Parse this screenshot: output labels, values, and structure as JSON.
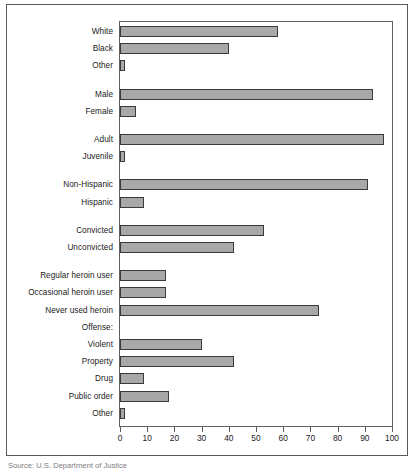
{
  "chart_data": {
    "type": "bar",
    "orientation": "horizontal",
    "title": "",
    "xlabel": "",
    "ylabel": "",
    "xlim": [
      0,
      100
    ],
    "xticks": [
      0,
      10,
      20,
      30,
      40,
      50,
      60,
      70,
      80,
      90,
      100
    ],
    "grid": false,
    "legend": null,
    "bar_color": "#a8a8a8",
    "bar_edge_color": "#3a3a3a",
    "categories": [
      "White",
      "Black",
      "Other",
      "Male",
      "Female",
      "Adult",
      "Juvenile",
      "Non-Hispanic",
      "Hispanic",
      "Convicted",
      "Unconvicted",
      "Regular heroin user",
      "Occasional heroin user",
      "Never used heroin",
      "Violent",
      "Property",
      "Drug",
      "Public order",
      "Other"
    ],
    "values": [
      58,
      40,
      2,
      93,
      6,
      97,
      2,
      91,
      9,
      53,
      42,
      17,
      17,
      73,
      30,
      42,
      9,
      18,
      2
    ],
    "group_header": "Offense:",
    "rows": [
      {
        "label": "White",
        "value": 58,
        "type": "bar",
        "gap_before": 0
      },
      {
        "label": "Black",
        "value": 40,
        "type": "bar",
        "gap_before": 0
      },
      {
        "label": "Other",
        "value": 2,
        "type": "bar",
        "gap_before": 0
      },
      {
        "label": "Male",
        "value": 93,
        "type": "bar",
        "gap_before": 1
      },
      {
        "label": "Female",
        "value": 6,
        "type": "bar",
        "gap_before": 0
      },
      {
        "label": "Adult",
        "value": 97,
        "type": "bar",
        "gap_before": 1
      },
      {
        "label": "Juvenile",
        "value": 2,
        "type": "bar",
        "gap_before": 0
      },
      {
        "label": "Non-Hispanic",
        "value": 91,
        "type": "bar",
        "gap_before": 1
      },
      {
        "label": "Hispanic",
        "value": 9,
        "type": "bar",
        "gap_before": 0
      },
      {
        "label": "Convicted",
        "value": 53,
        "type": "bar",
        "gap_before": 1
      },
      {
        "label": "Unconvicted",
        "value": 42,
        "type": "bar",
        "gap_before": 0
      },
      {
        "label": "Regular heroin user",
        "value": 17,
        "type": "bar",
        "gap_before": 1
      },
      {
        "label": "Occasional heroin user",
        "value": 17,
        "type": "bar",
        "gap_before": 0
      },
      {
        "label": "Never used heroin",
        "value": 73,
        "type": "bar",
        "gap_before": 0
      },
      {
        "label": "Offense:",
        "value": null,
        "type": "header",
        "gap_before": 0
      },
      {
        "label": "Violent",
        "value": 30,
        "type": "bar",
        "gap_before": 0
      },
      {
        "label": "Property",
        "value": 42,
        "type": "bar",
        "gap_before": 0
      },
      {
        "label": "Drug",
        "value": 9,
        "type": "bar",
        "gap_before": 0
      },
      {
        "label": "Public order",
        "value": 18,
        "type": "bar",
        "gap_before": 0
      },
      {
        "label": "Other",
        "value": 2,
        "type": "bar",
        "gap_before": 0
      }
    ]
  },
  "caption": "Source:  U.S. Department of Justice"
}
